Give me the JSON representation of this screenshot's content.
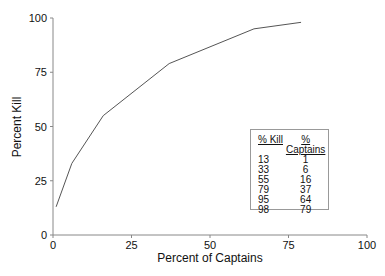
{
  "chart_data": {
    "type": "line",
    "title": "",
    "xlabel": "Percent of Captains",
    "ylabel": "Percent Kill",
    "xlim": [
      0,
      100
    ],
    "ylim": [
      0,
      100
    ],
    "x_ticks": [
      "0",
      "25",
      "50",
      "75",
      "100"
    ],
    "y_ticks": [
      "0",
      "25",
      "50",
      "75",
      "100"
    ],
    "grid": false,
    "series": [
      {
        "name": "Percent Kill vs Percent of Captains",
        "x": [
          1,
          6,
          16,
          37,
          64,
          79
        ],
        "y": [
          13,
          33,
          55,
          79,
          95,
          98
        ]
      }
    ],
    "table": {
      "headers": [
        "% Kill",
        "% Captains"
      ],
      "rows": [
        [
          "13",
          "1"
        ],
        [
          "33",
          "6"
        ],
        [
          "55",
          "16"
        ],
        [
          "79",
          "37"
        ],
        [
          "95",
          "64"
        ],
        [
          "98",
          "79"
        ]
      ]
    }
  }
}
